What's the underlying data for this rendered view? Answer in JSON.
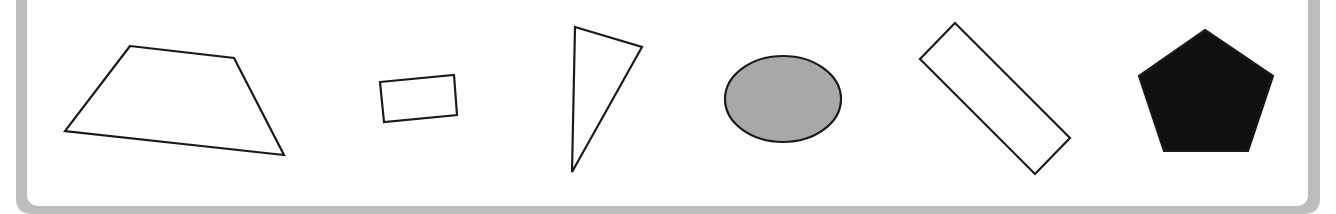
{
  "figure": {
    "frame": {
      "color": "#bdbdbd",
      "inner_fill": "#ffffff"
    },
    "stroke_color": "#1a1a1a",
    "shapes": [
      {
        "name": "trapezoid",
        "type": "polygon",
        "points": "130,46 234,58 284,155 65,131",
        "fill": "none"
      },
      {
        "name": "rectangle",
        "type": "polygon",
        "points": "380,82 454,75 457,115 384,122",
        "fill": "none"
      },
      {
        "name": "triangle",
        "type": "polygon",
        "points": "575,27 642,47 572,172",
        "fill": "none"
      },
      {
        "name": "ellipse",
        "type": "ellipse",
        "cx": 783,
        "cy": 99,
        "rx": 58,
        "ry": 43,
        "fill": "#a8a8a8"
      },
      {
        "name": "rotated-rectangle",
        "type": "polygon",
        "points": "955,23 920,59 1035,174 1070,138",
        "fill": "none"
      },
      {
        "name": "pentagon",
        "type": "polygon",
        "points": "1205,30 1273,76 1248,151 1164,151 1139,76",
        "fill": "#111111"
      }
    ]
  }
}
